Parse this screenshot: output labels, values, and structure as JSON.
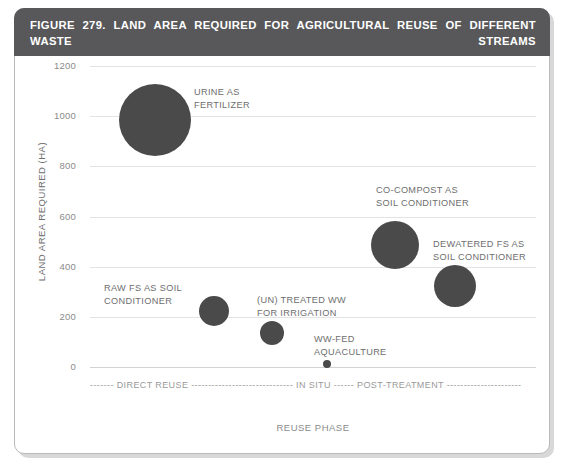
{
  "figure": {
    "title_line1": "FIGURE 279. LAND AREA REQUIRED FOR AGRICULTURAL REUSE OF DIFFERENT WASTE STREAMS",
    "title_line2_prefix": "GENERATED BY 100,000 PE YR",
    "title_line2_sup": "-1",
    "title_line2_suffix": ".",
    "title_bg": "#58585a",
    "bubble_color": "#4a4a4a",
    "grid_color": "#e3e3e3"
  },
  "chart_data": {
    "type": "scatter",
    "title": "FIGURE 279. LAND AREA REQUIRED FOR AGRICULTURAL REUSE OF DIFFERENT WASTE STREAMS GENERATED BY 100,000 PE YR-1.",
    "xlabel": "REUSE PHASE",
    "ylabel": "LAND AREA REQUIRED (HA)",
    "ylim": [
      0,
      1200
    ],
    "yticks": [
      1200,
      1000,
      800,
      600,
      400,
      200,
      0
    ],
    "ytick_labels": [
      "1200",
      "1000",
      "800",
      "600",
      "400",
      "200",
      "0"
    ],
    "grid": true,
    "legend": "none",
    "points": [
      {
        "name": "URINE AS FERTILIZER",
        "label": "URINE AS\nFERTILIZER",
        "x_frac": 0.145,
        "y": 985,
        "radius_px": 36,
        "label_left": 180,
        "label_top": 30
      },
      {
        "name": "RAW FS AS SOIL CONDITIONER",
        "label": "RAW FS AS SOIL\nCONDITIONER",
        "x_frac": 0.278,
        "y": 225,
        "radius_px": 15,
        "label_left": 90,
        "label_top": 226
      },
      {
        "name": "(UN) TREATED WW FOR IRRIGATION",
        "label": "(UN) TREATED WW\nFOR IRRIGATION",
        "x_frac": 0.408,
        "y": 135,
        "radius_px": 12,
        "label_left": 243,
        "label_top": 238
      },
      {
        "name": "WW-FED AQUACULTURE",
        "label": "WW-FED\nAQUACULTURE",
        "x_frac": 0.531,
        "y": 10,
        "radius_px": 4,
        "label_left": 300,
        "label_top": 277
      },
      {
        "name": "CO-COMPOST AS SOIL CONDITIONER",
        "label": "CO-COMPOST AS\nSOIL CONDITIONER",
        "x_frac": 0.684,
        "y": 488,
        "radius_px": 24,
        "label_left": 362,
        "label_top": 128
      },
      {
        "name": "DEWATERED FS AS SOIL CONDITIONER",
        "label": "DEWATERED FS AS\nSOIL CONDITIONER",
        "x_frac": 0.818,
        "y": 322,
        "radius_px": 21,
        "label_left": 419,
        "label_top": 182
      }
    ],
    "phase_annotation": {
      "full_text": "------- DIRECT REUSE ------------------------------ IN SITU ------ POST-TREATMENT ----------------------",
      "phases": [
        "DIRECT REUSE",
        "IN SITU",
        "POST-TREATMENT"
      ]
    }
  }
}
